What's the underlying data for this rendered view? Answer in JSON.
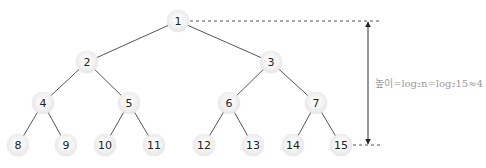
{
  "diagram": {
    "type": "complete-binary-tree",
    "nodes": [
      {
        "id": "1",
        "x": 178,
        "y": 21
      },
      {
        "id": "2",
        "x": 87,
        "y": 62
      },
      {
        "id": "3",
        "x": 271,
        "y": 62
      },
      {
        "id": "4",
        "x": 43,
        "y": 103
      },
      {
        "id": "5",
        "x": 129,
        "y": 103
      },
      {
        "id": "6",
        "x": 229,
        "y": 103
      },
      {
        "id": "7",
        "x": 316,
        "y": 103
      },
      {
        "id": "8",
        "x": 18,
        "y": 145
      },
      {
        "id": "9",
        "x": 66,
        "y": 145
      },
      {
        "id": "10",
        "x": 105,
        "y": 145
      },
      {
        "id": "11",
        "x": 154,
        "y": 145
      },
      {
        "id": "12",
        "x": 204,
        "y": 145
      },
      {
        "id": "13",
        "x": 253,
        "y": 145
      },
      {
        "id": "14",
        "x": 293,
        "y": 145
      },
      {
        "id": "15",
        "x": 341,
        "y": 145
      }
    ],
    "edges": [
      [
        "1",
        "2"
      ],
      [
        "1",
        "3"
      ],
      [
        "2",
        "4"
      ],
      [
        "2",
        "5"
      ],
      [
        "3",
        "6"
      ],
      [
        "3",
        "7"
      ],
      [
        "4",
        "8"
      ],
      [
        "4",
        "9"
      ],
      [
        "5",
        "10"
      ],
      [
        "5",
        "11"
      ],
      [
        "6",
        "12"
      ],
      [
        "6",
        "13"
      ],
      [
        "7",
        "14"
      ],
      [
        "7",
        "15"
      ]
    ],
    "height_label": "높이=log₂n=log₂15≈4",
    "colors": {
      "edge": "#555555",
      "dashed": "#555555",
      "node_edge": "#d9d9d9",
      "label": "#9a9a9a"
    }
  }
}
